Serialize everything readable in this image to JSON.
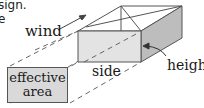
{
  "cropped_text": {
    "line1": "sign.",
    "line2": "e"
  },
  "labels": {
    "wind": "wind",
    "side": "side",
    "height": "height",
    "effective_area_line1": "effective",
    "effective_area_line2": "area"
  },
  "colors": {
    "front_face": "#e3e3e3",
    "side_face": "#bdbdbd",
    "top_face": "#ffffff",
    "line": "#555555",
    "area_box": "#d9d9d9"
  }
}
